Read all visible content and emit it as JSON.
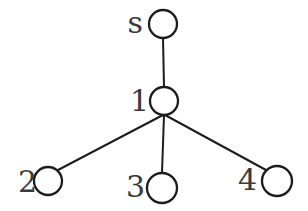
{
  "diagram": {
    "type": "graph",
    "colors": {
      "background": "#ffffff",
      "stroke": "#1c1c1c",
      "node_fill": "#ffffff",
      "label": "#3a3a3a"
    },
    "stroke_widths": {
      "edge": 2,
      "node": 2.3
    },
    "nodes": [
      {
        "id": "s",
        "label": "s",
        "cx": 163,
        "cy": 24,
        "r": 14,
        "label_x": 143,
        "label_y": 33
      },
      {
        "id": "1",
        "label": "1",
        "cx": 164,
        "cy": 101,
        "r": 14,
        "label_x": 149,
        "label_y": 111
      },
      {
        "id": "2",
        "label": "2",
        "cx": 48,
        "cy": 181,
        "r": 14,
        "label_x": 37,
        "label_y": 192
      },
      {
        "id": "3",
        "label": "3",
        "cx": 162,
        "cy": 188,
        "r": 15,
        "label_x": 145,
        "label_y": 197
      },
      {
        "id": "4",
        "label": "4",
        "cx": 277,
        "cy": 181,
        "r": 15,
        "label_x": 257,
        "label_y": 190
      }
    ],
    "edges": [
      {
        "from": "s",
        "to": "1",
        "x1": 163,
        "y1": 38,
        "x2": 164,
        "y2": 87
      },
      {
        "from": "1",
        "to": "2",
        "x1": 163,
        "y1": 115,
        "x2": 58,
        "y2": 170
      },
      {
        "from": "1",
        "to": "3",
        "x1": 164,
        "y1": 115,
        "x2": 162,
        "y2": 173
      },
      {
        "from": "1",
        "to": "4",
        "x1": 165,
        "y1": 115,
        "x2": 266,
        "y2": 170
      }
    ]
  }
}
